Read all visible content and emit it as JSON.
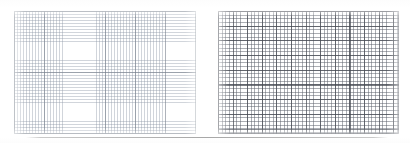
{
  "page": {
    "title": "Graph paper grid comparison",
    "background_color": "#ffffff",
    "width": 410,
    "height": 143
  },
  "panels": [
    {
      "id": "grid-left",
      "label": "Fine light graph grid",
      "description": "Pale blue-grey fine-ruled graph paper square",
      "line_color": "#8c96a5",
      "major_line_color": "#78808c",
      "x": 14,
      "y": 11,
      "width": 182,
      "height": 123,
      "minor_cell_px": 3,
      "major_every_cells": 10,
      "minor_columns": 60,
      "minor_rows": 40,
      "major_columns": 6,
      "major_rows": 4
    },
    {
      "id": "grid-right",
      "label": "Coarse dark graph grid",
      "description": "Darker grey coarse-ruled graph paper square",
      "line_color": "#5f646e",
      "major_line_color": "#464a52",
      "x": 218,
      "y": 11,
      "width": 181,
      "height": 123,
      "minor_cell_px": 3.65,
      "major_every_cells": 4,
      "minor_columns": 49,
      "minor_rows": 33,
      "major_columns": 12,
      "major_rows": 8
    }
  ],
  "rule": {
    "name": "bottom-rule",
    "color": "#787878",
    "y": 137,
    "x": 26,
    "width": 362
  },
  "chart_data": {
    "type": "table",
    "title": "Graph paper grid comparison",
    "categories": [
      "Left grid (fine)",
      "Right grid (coarse)"
    ],
    "series": [
      {
        "name": "minor columns",
        "values": [
          60,
          49
        ]
      },
      {
        "name": "minor rows",
        "values": [
          40,
          33
        ]
      },
      {
        "name": "major columns",
        "values": [
          6,
          12
        ]
      },
      {
        "name": "major rows",
        "values": [
          4,
          8
        ]
      },
      {
        "name": "minor cell size (px)",
        "values": [
          3,
          3.65
        ]
      }
    ],
    "xlabel": "Grid panel",
    "ylabel": "Line count",
    "grid": true,
    "legend": "none"
  }
}
